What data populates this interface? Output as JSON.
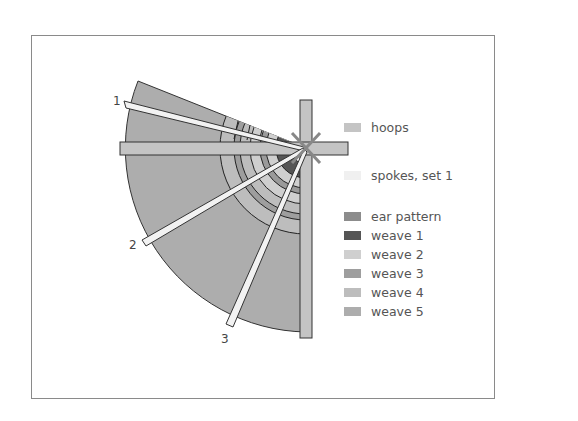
{
  "diagram": {
    "spoke_labels": [
      "1",
      "2",
      "3"
    ],
    "legend": [
      {
        "key": "hoops",
        "label": "hoops",
        "color": "#c4c4c4"
      },
      {
        "key": "spokes",
        "label": "spokes, set 1",
        "color": "#f0f0f0"
      },
      {
        "key": "ear",
        "label": "ear pattern",
        "color": "#8c8c8c"
      },
      {
        "key": "weave1",
        "label": "weave 1",
        "color": "#555555"
      },
      {
        "key": "weave2",
        "label": "weave 2",
        "color": "#cfcfcf"
      },
      {
        "key": "weave3",
        "label": "weave 3",
        "color": "#9e9e9e"
      },
      {
        "key": "weave4",
        "label": "weave 4",
        "color": "#bdbdbd"
      },
      {
        "key": "weave5",
        "label": "weave 5",
        "color": "#adadad"
      }
    ]
  }
}
